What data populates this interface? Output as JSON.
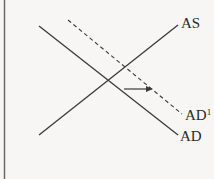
{
  "diagram": {
    "title": "",
    "colors": {
      "line": "#3a3a3a",
      "background": "#f7f6f4",
      "border": "#6a6a6a"
    },
    "curves": [
      {
        "id": "AS",
        "label": "AS",
        "style": "solid"
      },
      {
        "id": "AD",
        "label": "AD",
        "style": "solid"
      },
      {
        "id": "AD1",
        "label": "AD",
        "label_superscript": "1",
        "style": "dashed"
      }
    ],
    "shift": {
      "from": "AD",
      "to": "AD1",
      "direction": "right"
    }
  }
}
